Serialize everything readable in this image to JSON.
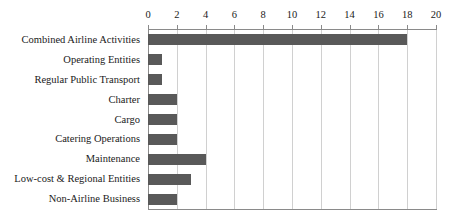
{
  "chart_data": {
    "type": "bar",
    "orientation": "horizontal",
    "title": "",
    "subtitle": "",
    "xlabel": "",
    "ylabel": "",
    "xlim": [
      0,
      20
    ],
    "xticks": [
      0,
      2,
      4,
      6,
      8,
      10,
      12,
      14,
      16,
      18,
      20
    ],
    "xtick_labels": [
      "0",
      "2",
      "4",
      "6",
      "8",
      "10",
      "12",
      "14",
      "16",
      "18",
      "20"
    ],
    "x_axis_position": "top",
    "grid": {
      "vertical": true,
      "horizontal": false,
      "color": "#d0d0d0"
    },
    "legend": {
      "visible": false,
      "position": "none",
      "entries": []
    },
    "bar_color": "#595959",
    "axis_color": "#8a8a8a",
    "background": "#ffffff",
    "categories": [
      "Combined Airline Activities",
      "Operating Entities",
      "Regular Public Transport",
      "Charter",
      "Cargo",
      "Catering Operations",
      "Maintenance",
      "Low-cost & Regional Entities",
      "Non-Airline Business"
    ],
    "values": [
      18,
      1,
      1,
      2,
      2,
      2,
      4,
      3,
      2
    ],
    "annotations": []
  }
}
